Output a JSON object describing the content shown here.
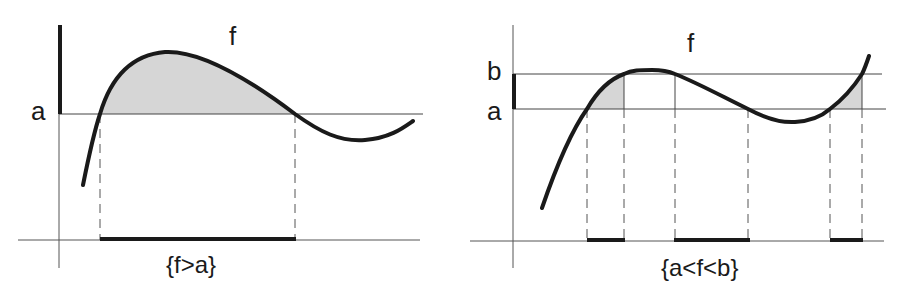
{
  "left_panel": {
    "function_label": "f",
    "level_label": "a",
    "set_label": "{f>a}"
  },
  "right_panel": {
    "function_label": "f",
    "upper_level_label": "b",
    "lower_level_label": "a",
    "set_label": "{a<f<b}"
  },
  "colors": {
    "curve": "#1a1a1a",
    "shade": "#d6d6d6",
    "axis": "#555555"
  }
}
